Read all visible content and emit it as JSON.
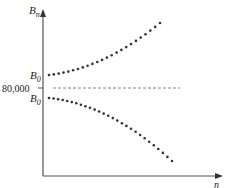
{
  "chart_data": {
    "type": "scatter",
    "title": "",
    "xlabel": "n",
    "ylabel": "B_n",
    "ylabel_main": "B",
    "ylabel_sub": "n",
    "y_ticks": [
      {
        "label": "80,000",
        "role": "reference"
      }
    ],
    "annotations": [
      {
        "label_main": "B",
        "label_sub": "0",
        "position": "above reference line",
        "note": "upper curve start"
      },
      {
        "label_main": "B",
        "label_sub": "0",
        "position": "below reference line",
        "note": "lower curve start"
      }
    ],
    "reference_line": {
      "y": 80000,
      "style": "dashed"
    },
    "series": [
      {
        "name": "B_0 above 80,000 (increasing)",
        "trend": "increasing, accelerating away from 80,000"
      },
      {
        "name": "B_0 below 80,000 (decreasing)",
        "trend": "decreasing, accelerating away from 80,000"
      }
    ],
    "grid": false,
    "legend": null
  },
  "labels": {
    "y_axis_main": "B",
    "y_axis_sub": "n",
    "x_axis": "n",
    "tick_80000": "80,000",
    "b0_upper_main": "B",
    "b0_upper_sub": "0",
    "b0_lower_main": "B",
    "b0_lower_sub": "0"
  },
  "colors": {
    "axis": "#555555",
    "dots": "#333333",
    "dashed": "#666666"
  }
}
